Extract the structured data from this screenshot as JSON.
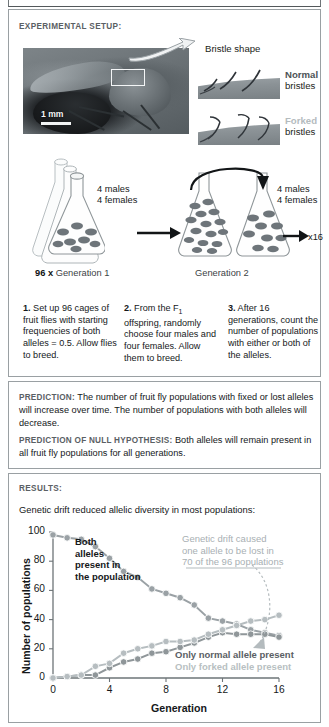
{
  "sections": {
    "setup_label": "EXPERIMENTAL SETUP:",
    "results_label": "RESULTS:"
  },
  "photo": {
    "scalebar_label": "1 mm"
  },
  "bristles": {
    "title": "Bristle shape",
    "normal_strong": "Normal",
    "normal_plain": "bristles",
    "forked_strong": "Forked",
    "forked_plain": "bristles"
  },
  "flasks": {
    "gen1_counts": "4 males\n4 females",
    "gen2_counts": "4 males\n4 females",
    "multiplier": "x16",
    "gen1_caption_bold": "96 x",
    "gen1_caption": " Generation 1",
    "gen2_caption": "Generation 2"
  },
  "steps": [
    {
      "number": "1.",
      "text": " Set up 96 cages of fruit flies with starting frequencies of both alleles = 0.5. Allow flies to breed."
    },
    {
      "number": "2.",
      "text_a": " From the F",
      "sub": "1",
      "text_b": " offspring, randomly choose four males and four females. Allow them to breed."
    },
    {
      "number": "3.",
      "text": " After 16 generations, count the number of populations with either or both of the alleles."
    }
  ],
  "predictions": [
    {
      "tag": "PREDICTION:",
      "text": " The number of fruit fly populations with fixed or lost alleles will increase over time. The number of populations with both alleles will decrease."
    },
    {
      "tag": "PREDICTION OF NULL HYPOTHESIS:",
      "text": " Both alleles will remain present in all fruit fly populations for all generations."
    }
  ],
  "results": {
    "caption": "Genetic drift reduced allelic diversity in most populations:",
    "both_note": "Both\nalleles\npresent in\nthe population",
    "drift_note": "Genetic drift caused\none allele to be lost in\n70 of the 96 populations"
  },
  "chart_data": {
    "type": "line",
    "title": "Genetic drift reduced allelic diversity in most populations:",
    "xlabel": "Generation",
    "ylabel": "Number of populations",
    "xlim": [
      0,
      16
    ],
    "ylim": [
      0,
      100
    ],
    "xticks": [
      0,
      4,
      8,
      12,
      16
    ],
    "yticks": [
      0,
      20,
      40,
      60,
      80,
      100
    ],
    "grid": false,
    "legend_position": "inside-right",
    "x": [
      0,
      1,
      2,
      3,
      4,
      5,
      6,
      7,
      8,
      9,
      10,
      11,
      12,
      13,
      14,
      15,
      16
    ],
    "series": [
      {
        "name": "Both alleles present in the population",
        "color": "#9aa1a5",
        "values": [
          98,
          96,
          95,
          90,
          82,
          73,
          69,
          61,
          58,
          55,
          50,
          41,
          39,
          37,
          33,
          31,
          29
        ]
      },
      {
        "name": "Only normal allele present",
        "color": "#8f9699",
        "values": [
          0,
          1,
          2,
          2,
          7,
          11,
          13,
          17,
          18,
          21,
          24,
          28,
          31,
          30,
          30,
          30,
          28
        ]
      },
      {
        "name": "Only forked allele present",
        "color": "#b6bdc0",
        "values": [
          0,
          1,
          2,
          8,
          10,
          17,
          20,
          22,
          25,
          25,
          26,
          30,
          33,
          36,
          39,
          40,
          43
        ]
      }
    ],
    "legend": [
      {
        "label": "Only normal allele present",
        "color": "#5a6064"
      },
      {
        "label": "Only forked allele present",
        "color": "#b8bfc2"
      }
    ],
    "annotations": [
      {
        "text": "Both alleles present in the population"
      },
      {
        "text": "Genetic drift caused one allele to be lost in 70 of the 96 populations"
      }
    ]
  }
}
